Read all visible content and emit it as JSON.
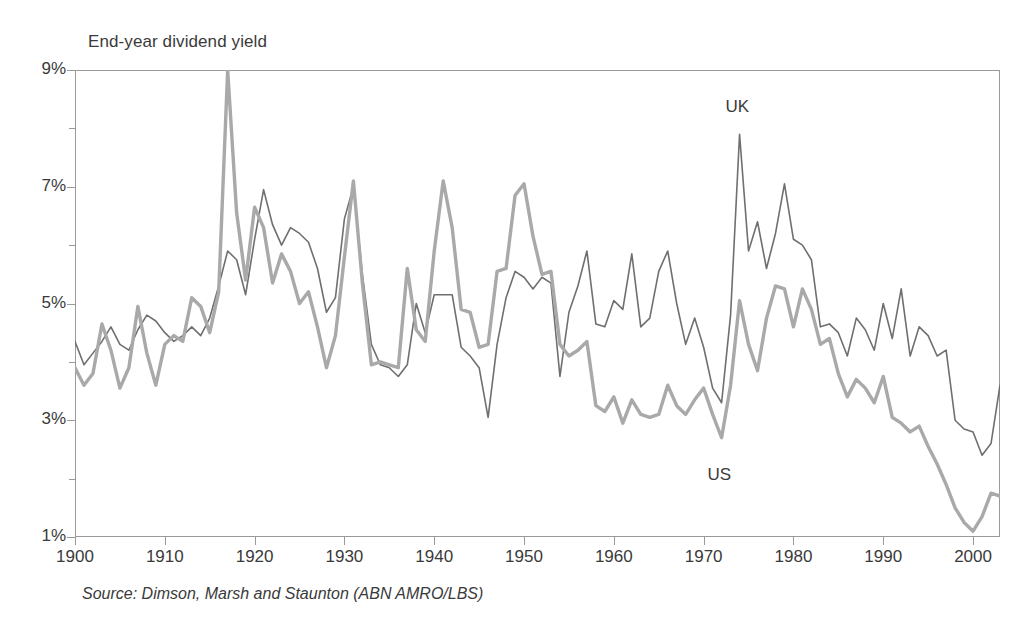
{
  "chart_data": {
    "type": "line",
    "title": "End-year dividend yield",
    "xlabel": "",
    "ylabel": "",
    "xlim": [
      1900,
      2003
    ],
    "ylim": [
      1,
      9
    ],
    "grid": false,
    "legend_position": "inline-annotation",
    "y_tick_labels": [
      "9%",
      "7%",
      "5%",
      "3%",
      "1%"
    ],
    "y_tick_values": [
      9,
      7,
      5,
      3,
      1
    ],
    "y_minor_ticks": [
      8,
      6,
      4,
      2
    ],
    "x_tick_labels": [
      "1900",
      "1910",
      "1920",
      "1930",
      "1940",
      "1950",
      "1960",
      "1970",
      "1980",
      "1990",
      "2000"
    ],
    "x_tick_values": [
      1900,
      1910,
      1920,
      1930,
      1940,
      1950,
      1960,
      1970,
      1980,
      1990,
      2000
    ],
    "annotations": [
      {
        "text": "UK",
        "x": 1974,
        "y": 8.35
      },
      {
        "text": "US",
        "x": 1972,
        "y": 2.05
      }
    ],
    "source": "Source: Dimson, Marsh and Staunton (ABN AMRO/LBS)",
    "x": [
      1900,
      1901,
      1902,
      1903,
      1904,
      1905,
      1906,
      1907,
      1908,
      1909,
      1910,
      1911,
      1912,
      1913,
      1914,
      1915,
      1916,
      1917,
      1918,
      1919,
      1920,
      1921,
      1922,
      1923,
      1924,
      1925,
      1926,
      1927,
      1928,
      1929,
      1930,
      1931,
      1932,
      1933,
      1934,
      1935,
      1936,
      1937,
      1938,
      1939,
      1940,
      1941,
      1942,
      1943,
      1944,
      1945,
      1946,
      1947,
      1948,
      1949,
      1950,
      1951,
      1952,
      1953,
      1954,
      1955,
      1956,
      1957,
      1958,
      1959,
      1960,
      1961,
      1962,
      1963,
      1964,
      1965,
      1966,
      1967,
      1968,
      1969,
      1970,
      1971,
      1972,
      1973,
      1974,
      1975,
      1976,
      1977,
      1978,
      1979,
      1980,
      1981,
      1982,
      1983,
      1984,
      1985,
      1986,
      1987,
      1988,
      1989,
      1990,
      1991,
      1992,
      1993,
      1994,
      1995,
      1996,
      1997,
      1998,
      1999,
      2000,
      2001,
      2002,
      2003
    ],
    "series": [
      {
        "name": "UK",
        "color": "#6f6f6f",
        "line_width": 1.6,
        "values": [
          4.35,
          3.95,
          4.15,
          4.35,
          4.6,
          4.3,
          4.2,
          4.55,
          4.8,
          4.7,
          4.5,
          4.35,
          4.45,
          4.6,
          4.45,
          4.75,
          5.3,
          5.9,
          5.75,
          5.15,
          6.1,
          6.95,
          6.35,
          6.0,
          6.3,
          6.2,
          6.05,
          5.6,
          4.85,
          5.1,
          6.45,
          7.0,
          5.5,
          4.3,
          3.95,
          3.9,
          3.75,
          3.95,
          5.0,
          4.5,
          5.15,
          5.15,
          5.15,
          4.25,
          4.1,
          3.9,
          3.05,
          4.3,
          5.1,
          5.55,
          5.45,
          5.25,
          5.45,
          5.35,
          3.75,
          4.85,
          5.3,
          5.9,
          4.65,
          4.6,
          5.05,
          4.9,
          5.85,
          4.6,
          4.75,
          5.55,
          5.9,
          5.0,
          4.3,
          4.75,
          4.25,
          3.55,
          3.3,
          4.8,
          7.9,
          5.9,
          6.4,
          5.6,
          6.2,
          7.05,
          6.1,
          6.0,
          5.75,
          4.6,
          4.65,
          4.5,
          4.1,
          4.75,
          4.55,
          4.2,
          5.0,
          4.4,
          5.25,
          4.1,
          4.6,
          4.45,
          4.1,
          4.2,
          3.0,
          2.85,
          2.8,
          2.4,
          2.6,
          3.6
        ]
      },
      {
        "name": "US",
        "color": "#a9a9a9",
        "line_width": 3.4,
        "values": [
          3.9,
          3.6,
          3.8,
          4.65,
          4.2,
          3.55,
          3.9,
          4.95,
          4.15,
          3.6,
          4.3,
          4.45,
          4.35,
          5.1,
          4.95,
          4.5,
          5.2,
          9.0,
          6.55,
          5.4,
          6.65,
          6.3,
          5.35,
          5.85,
          5.55,
          5.0,
          5.2,
          4.6,
          3.9,
          4.45,
          5.8,
          7.1,
          5.35,
          3.95,
          4.0,
          3.95,
          3.9,
          5.6,
          4.55,
          4.35,
          5.9,
          7.1,
          6.3,
          4.9,
          4.85,
          4.25,
          4.3,
          5.55,
          5.6,
          6.85,
          7.05,
          6.15,
          5.5,
          5.55,
          4.3,
          4.1,
          4.2,
          4.35,
          3.25,
          3.15,
          3.4,
          2.95,
          3.35,
          3.1,
          3.05,
          3.1,
          3.6,
          3.25,
          3.1,
          3.35,
          3.55,
          3.1,
          2.7,
          3.6,
          5.05,
          4.3,
          3.85,
          4.75,
          5.3,
          5.25,
          4.6,
          5.25,
          4.9,
          4.3,
          4.4,
          3.8,
          3.4,
          3.7,
          3.55,
          3.3,
          3.75,
          3.05,
          2.95,
          2.8,
          2.9,
          2.55,
          2.25,
          1.9,
          1.5,
          1.25,
          1.1,
          1.35,
          1.75,
          1.7
        ]
      }
    ]
  }
}
